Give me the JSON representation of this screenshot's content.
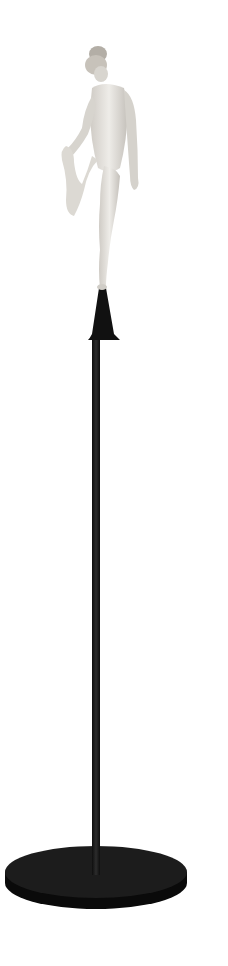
{
  "image": {
    "description": "Sculpture of a nude female figure balancing on one leg, holding her raised foot, mounted on a small black cone atop a tall thin black pole with a round black disc base, on white background",
    "colors": {
      "background": "#ffffff",
      "figure": "#e4e2de",
      "figure_shadow": "#b9b6b0",
      "pole": "#1a1a1a",
      "base": "#151515"
    }
  }
}
